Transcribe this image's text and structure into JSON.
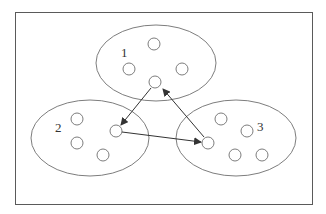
{
  "diagram": {
    "type": "cluster-graph",
    "frame": {
      "x": 15,
      "y": 12,
      "width": 297,
      "height": 192
    },
    "colors": {
      "stroke": "#6e6e6e",
      "arrow": "#333333",
      "frame": "#5a5a5a",
      "background": "#ffffff"
    },
    "clusters": [
      {
        "id": "1",
        "label": "1",
        "ellipse": {
          "cx": 156,
          "cy": 63,
          "rx": 60,
          "ry": 38
        },
        "label_pos": {
          "x": 121,
          "y": 57
        },
        "nodes": [
          {
            "cx": 154,
            "cy": 44
          },
          {
            "cx": 129,
            "cy": 69
          },
          {
            "cx": 182,
            "cy": 69
          },
          {
            "cx": 155,
            "cy": 82
          }
        ]
      },
      {
        "id": "2",
        "label": "2",
        "ellipse": {
          "cx": 90,
          "cy": 138,
          "rx": 59,
          "ry": 38
        },
        "label_pos": {
          "x": 55,
          "y": 132
        },
        "nodes": [
          {
            "cx": 77,
            "cy": 119
          },
          {
            "cx": 77,
            "cy": 143
          },
          {
            "cx": 103,
            "cy": 155
          },
          {
            "cx": 116,
            "cy": 131
          }
        ]
      },
      {
        "id": "3",
        "label": "3",
        "ellipse": {
          "cx": 236,
          "cy": 138,
          "rx": 60,
          "ry": 38
        },
        "label_pos": {
          "x": 257,
          "y": 131
        },
        "nodes": [
          {
            "cx": 221,
            "cy": 119
          },
          {
            "cx": 247,
            "cy": 131
          },
          {
            "cx": 208,
            "cy": 143
          },
          {
            "cx": 235,
            "cy": 155
          },
          {
            "cx": 262,
            "cy": 155
          }
        ]
      }
    ],
    "node_radius": 6,
    "edges": [
      {
        "from": "cluster1-node4",
        "to": "cluster2-node4",
        "x1": 151,
        "y1": 88,
        "x2": 121,
        "y2": 125
      },
      {
        "from": "cluster2-node4",
        "to": "cluster3-node3",
        "x1": 122,
        "y1": 132,
        "x2": 201,
        "y2": 142
      },
      {
        "from": "cluster3-node3",
        "to": "cluster1-node4",
        "x1": 204,
        "y1": 137,
        "x2": 163,
        "y2": 89
      }
    ]
  }
}
